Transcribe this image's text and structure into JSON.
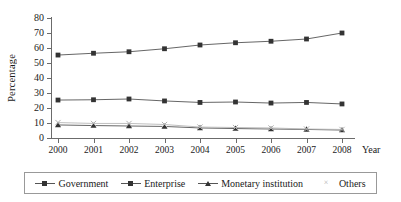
{
  "chart_data": {
    "type": "line",
    "title": "",
    "xlabel": "Year",
    "ylabel": "Percentage",
    "categories": [
      "2000",
      "2001",
      "2002",
      "2003",
      "2004",
      "2005",
      "2006",
      "2007",
      "2008"
    ],
    "x": [
      2000,
      2001,
      2002,
      2003,
      2004,
      2005,
      2006,
      2007,
      2008
    ],
    "ylim": [
      0,
      80
    ],
    "yticks": [
      0,
      10,
      20,
      30,
      40,
      50,
      60,
      70,
      80
    ],
    "ytick_labels": [
      "0",
      "10",
      "20",
      "30",
      "40",
      "50",
      "60",
      "70",
      "80"
    ],
    "grid": false,
    "legend_position": "bottom",
    "series": [
      {
        "name": "Government",
        "marker": "square",
        "color": "#333333",
        "values": [
          55.3,
          56.5,
          57.5,
          59.5,
          62.0,
          63.5,
          64.5,
          66.0,
          70.0
        ]
      },
      {
        "name": "Enterprise",
        "marker": "square",
        "color": "#333333",
        "values": [
          25.3,
          25.5,
          26.0,
          24.7,
          23.7,
          24.0,
          23.3,
          23.7,
          22.7
        ]
      },
      {
        "name": "Monetary institution",
        "marker": "triangle",
        "color": "#333333",
        "values": [
          8.7,
          8.3,
          8.0,
          7.7,
          6.7,
          6.3,
          6.0,
          5.7,
          5.3
        ]
      },
      {
        "name": "Others",
        "marker": "cross",
        "color": "#b0b0b0",
        "values": [
          10.3,
          9.7,
          9.7,
          9.0,
          7.3,
          7.0,
          6.7,
          6.0,
          5.7
        ]
      }
    ]
  },
  "axis": {
    "y_title": "Percentage",
    "x_title": "Year"
  },
  "legend": {
    "items": [
      {
        "label": "Government"
      },
      {
        "label": "Enterprise"
      },
      {
        "label": "Monetary institution"
      },
      {
        "label": "Others"
      }
    ]
  }
}
